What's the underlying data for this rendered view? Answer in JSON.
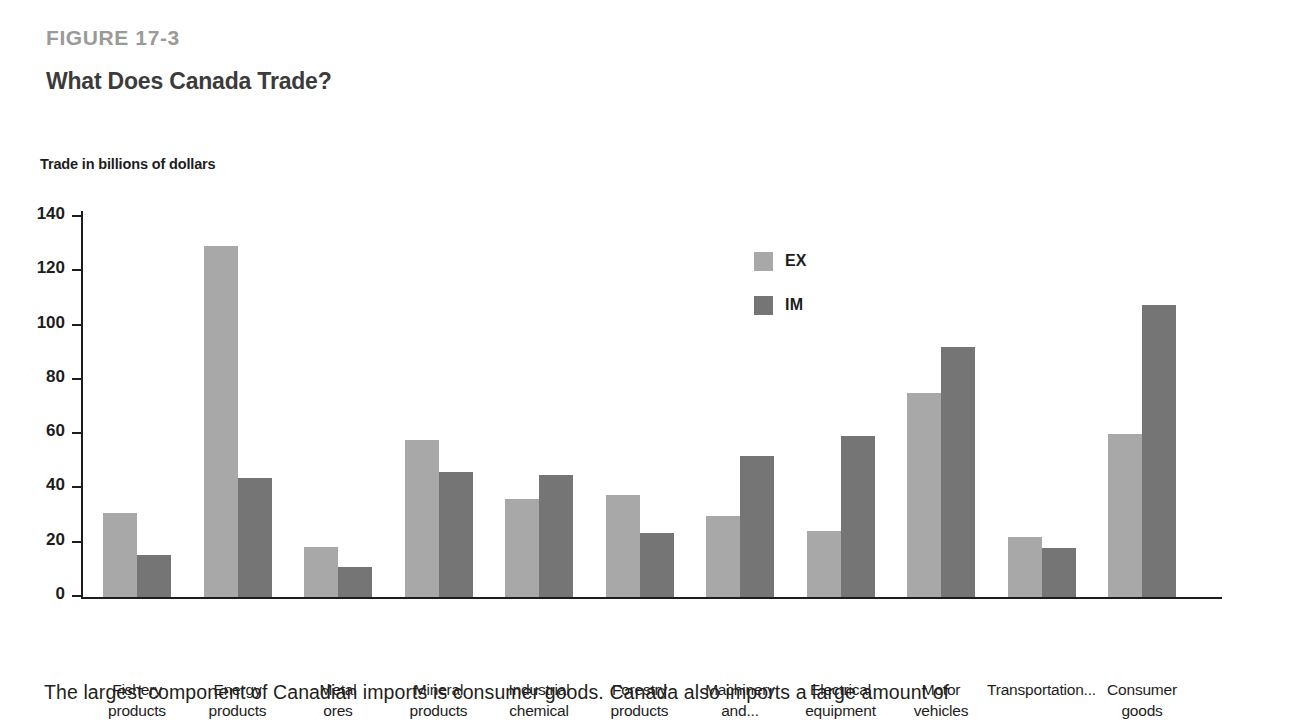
{
  "header": {
    "figure_number": "FIGURE 17-3",
    "title": "What Does Canada Trade?"
  },
  "caption": "The largest component of Canadian imports is consumer goods. Canada also imports a large amount of",
  "colors": {
    "export_bar": "#a8a8a8",
    "import_bar": "#757575",
    "axis": "#1d1d1d",
    "figure_number": "#9a9a9a",
    "title": "#3b3b3b"
  },
  "chart_data": {
    "type": "bar",
    "title": "What Does Canada Trade?",
    "subtitle": "FIGURE 17-3",
    "ylabel": "Trade in billions of dollars",
    "xlabel": "",
    "ylim": [
      0,
      140
    ],
    "yticks": [
      0,
      20,
      40,
      60,
      80,
      100,
      120,
      140
    ],
    "ytick_labels": [
      "0",
      "20",
      "40",
      "60",
      "80",
      "100",
      "120",
      "140"
    ],
    "grid": false,
    "legend_position": "upper center-right",
    "categories": [
      "Fishery\nproducts",
      "Energy\nproducts",
      "Metal\nores",
      "Mineral\nproducts",
      "Industrial\nchemical",
      "Forestry\nproducts",
      "Machinery\nand...",
      "Electrical\nequipment",
      "Motor\nvehicles",
      "Transportation...",
      "Consumer\ngoods"
    ],
    "series": [
      {
        "name": "EX",
        "color": "#a8a8a8",
        "values": [
          31,
          129.5,
          18.5,
          58,
          36,
          37.5,
          30,
          24.5,
          75,
          22,
          60
        ]
      },
      {
        "name": "IM",
        "color": "#757575",
        "values": [
          15.5,
          44,
          11,
          46,
          45,
          23.5,
          52,
          59.5,
          92,
          18,
          107.5
        ]
      }
    ]
  }
}
